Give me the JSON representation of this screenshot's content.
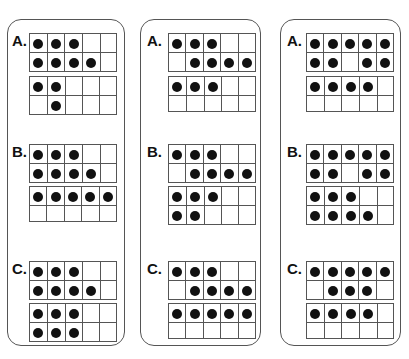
{
  "worksheet": {
    "columns": [
      {
        "problems": [
          {
            "label": "A.",
            "frames": [
              [
                [
                  1,
                  1,
                  1,
                  0,
                  0
                ],
                [
                  1,
                  1,
                  1,
                  1,
                  0
                ]
              ],
              [
                [
                  1,
                  1,
                  0,
                  0,
                  0
                ],
                [
                  0,
                  1,
                  0,
                  0,
                  0
                ]
              ]
            ]
          },
          {
            "label": "B.",
            "frames": [
              [
                [
                  1,
                  1,
                  1,
                  0,
                  0
                ],
                [
                  1,
                  1,
                  1,
                  1,
                  0
                ]
              ],
              [
                [
                  1,
                  1,
                  1,
                  1,
                  1
                ],
                [
                  0,
                  0,
                  0,
                  0,
                  0
                ]
              ]
            ]
          },
          {
            "label": "C.",
            "frames": [
              [
                [
                  1,
                  1,
                  1,
                  0,
                  0
                ],
                [
                  1,
                  1,
                  1,
                  1,
                  0
                ]
              ],
              [
                [
                  1,
                  1,
                  1,
                  0,
                  0
                ],
                [
                  1,
                  1,
                  1,
                  0,
                  0
                ]
              ]
            ]
          }
        ]
      },
      {
        "problems": [
          {
            "label": "A.",
            "frames": [
              [
                [
                  1,
                  1,
                  1,
                  0,
                  0
                ],
                [
                  0,
                  1,
                  1,
                  1,
                  1
                ]
              ],
              [
                [
                  1,
                  1,
                  1,
                  0,
                  0
                ],
                [
                  0,
                  0,
                  0,
                  0,
                  0
                ]
              ]
            ]
          },
          {
            "label": "B.",
            "frames": [
              [
                [
                  1,
                  1,
                  1,
                  0,
                  0
                ],
                [
                  0,
                  1,
                  1,
                  1,
                  1
                ]
              ],
              [
                [
                  1,
                  1,
                  1,
                  0,
                  0
                ],
                [
                  1,
                  1,
                  0,
                  0,
                  0
                ]
              ]
            ]
          },
          {
            "label": "C.",
            "frames": [
              [
                [
                  1,
                  1,
                  1,
                  0,
                  0
                ],
                [
                  0,
                  1,
                  1,
                  1,
                  1
                ]
              ],
              [
                [
                  1,
                  1,
                  1,
                  1,
                  1
                ],
                [
                  0,
                  0,
                  0,
                  0,
                  0
                ]
              ]
            ]
          }
        ]
      },
      {
        "problems": [
          {
            "label": "A.",
            "frames": [
              [
                [
                  1,
                  1,
                  1,
                  1,
                  1
                ],
                [
                  1,
                  1,
                  0,
                  1,
                  1
                ]
              ],
              [
                [
                  1,
                  1,
                  1,
                  1,
                  0
                ],
                [
                  0,
                  0,
                  0,
                  0,
                  0
                ]
              ]
            ]
          },
          {
            "label": "B.",
            "frames": [
              [
                [
                  1,
                  1,
                  1,
                  1,
                  1
                ],
                [
                  1,
                  1,
                  0,
                  1,
                  1
                ]
              ],
              [
                [
                  1,
                  1,
                  1,
                  0,
                  0
                ],
                [
                  1,
                  1,
                  1,
                  1,
                  0
                ]
              ]
            ]
          },
          {
            "label": "C.",
            "frames": [
              [
                [
                  1,
                  1,
                  1,
                  1,
                  1
                ],
                [
                  0,
                  1,
                  1,
                  1,
                  0
                ]
              ],
              [
                [
                  1,
                  1,
                  1,
                  1,
                  0
                ],
                [
                  0,
                  0,
                  0,
                  0,
                  0
                ]
              ]
            ]
          }
        ]
      }
    ]
  }
}
